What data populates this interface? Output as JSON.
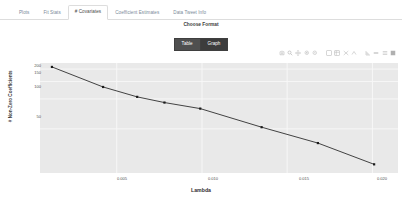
{
  "tabs": [
    {
      "label": "Plots",
      "active": false
    },
    {
      "label": "Fit Stats",
      "active": false
    },
    {
      "label": "# Covariates",
      "active": true
    },
    {
      "label": "Coefficient Estimates",
      "active": false
    },
    {
      "label": "Data Tweet Info",
      "active": false
    }
  ],
  "format": {
    "label": "Choose Format",
    "buttons": [
      {
        "label": "Table",
        "selected": false
      },
      {
        "label": "Graph",
        "selected": true
      }
    ]
  },
  "modebar": {
    "icons": [
      "camera-icon",
      "zoom-box-icon",
      "pan-icon",
      "zoom-in-icon",
      "zoom-out-icon",
      "autoscale-icon",
      "reset-axes-icon",
      "spike-lines-icon",
      "hover-compare-icon",
      "hover-closest-icon",
      "toggle-spikelines-icon",
      "plotly-logo-icon"
    ]
  },
  "chart_data": {
    "type": "line",
    "title": "",
    "xlabel": "Lambda",
    "ylabel": "# Non-Zero Coefficients",
    "x": [
      0.0012,
      0.0042,
      0.0062,
      0.0078,
      0.0099,
      0.0135,
      0.0168,
      0.0201
    ],
    "y": [
      210,
      132,
      105,
      92,
      80,
      52,
      36,
      22
    ],
    "xticks": [
      "0.005",
      "0.010",
      "0.015",
      "0.020"
    ],
    "xtick_values": [
      0.005,
      0.01,
      0.015,
      0.02
    ],
    "yticks": [
      "200",
      "150",
      "100",
      "50"
    ],
    "ytick_values": [
      200,
      150,
      100,
      50
    ],
    "yscale": "log",
    "xlim": [
      0.0005,
      0.0215
    ],
    "ylim": [
      18,
      230
    ],
    "grid": true,
    "legend": false,
    "marker_color": "#1a1a1a",
    "line_color": "#2f2f2f",
    "plot_bgcolor": "#e9e9e9",
    "paper_bgcolor": "#ffffff"
  }
}
